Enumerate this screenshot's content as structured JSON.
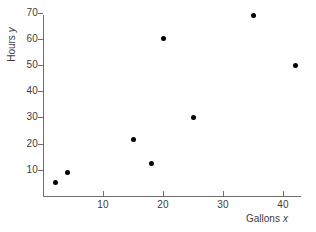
{
  "chart_data": {
    "type": "scatter",
    "title": "",
    "xlabel": "Gallons x",
    "ylabel": "Hours y",
    "xlabel_text": "Gallons",
    "xlabel_var": "x",
    "ylabel_text": "Hours",
    "ylabel_var": "y",
    "xlim": [
      0,
      43
    ],
    "ylim": [
      0,
      73
    ],
    "xticks": [
      10,
      20,
      30,
      40
    ],
    "yticks": [
      10,
      20,
      30,
      40,
      50,
      60,
      70
    ],
    "xtick_labels": [
      "10",
      "20",
      "30",
      "40"
    ],
    "ytick_labels": [
      "10",
      "20",
      "30",
      "40",
      "50",
      "60",
      "70"
    ],
    "grid": false,
    "legend": false,
    "marker_color": "#000000",
    "axis_color": "#6e6e6e",
    "background": "#ffffff",
    "points": [
      {
        "x": 2,
        "y": 5
      },
      {
        "x": 4,
        "y": 9
      },
      {
        "x": 15,
        "y": 21.5
      },
      {
        "x": 18,
        "y": 12.3
      },
      {
        "x": 20,
        "y": 60
      },
      {
        "x": 25,
        "y": 30
      },
      {
        "x": 35,
        "y": 69
      },
      {
        "x": 42,
        "y": 50
      }
    ]
  }
}
